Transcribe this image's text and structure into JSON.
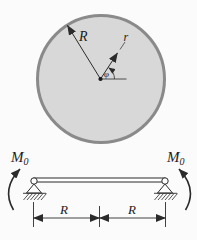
{
  "palette": {
    "background": "#fbfbfb",
    "disk_fill": "#d8d8d8",
    "disk_stroke": "#8a8a8a",
    "ink": "#2b2b2b"
  },
  "disk": {
    "outer_radius_label": "R",
    "inner_radius_label": "r",
    "angle_label": "φ"
  },
  "beam": {
    "left_moment": {
      "symbol": "M",
      "subscript": "0"
    },
    "right_moment": {
      "symbol": "M",
      "subscript": "0"
    },
    "dimensions": {
      "left": "R",
      "right": "R"
    }
  }
}
